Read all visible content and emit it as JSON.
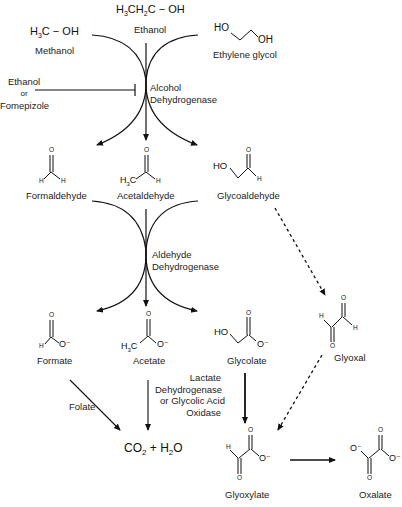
{
  "diagram": {
    "substrates": [
      {
        "id": "methanol",
        "formula": "H3C − OH",
        "name": "Methanol"
      },
      {
        "id": "ethanol",
        "formula": "H3CH2C − OH",
        "name": "Ethanol"
      },
      {
        "id": "ethylene_glycol",
        "formula_atoms": [
          "HO",
          "OH"
        ],
        "name": "Ethylene glycol"
      }
    ],
    "inhibitor": {
      "line1": "Ethanol",
      "line2": "or",
      "line3": "Fomepizole"
    },
    "enzymes": {
      "adh": {
        "line1": "Alcohol",
        "line2": "Dehydrogenase"
      },
      "aldh": {
        "line1": "Aldehyde",
        "line2": "Dehydrogenase"
      },
      "ldh": {
        "line1": "Lactate",
        "line2": "Dehydrogenase",
        "line3": "or Glycolic Acid",
        "line4": "Oxidase"
      },
      "folate": "Folate"
    },
    "aldehydes": [
      {
        "id": "formaldehyde",
        "name": "Formaldehyde",
        "atoms": {
          "o": "O",
          "h1": "H",
          "h2": "H"
        }
      },
      {
        "id": "acetaldehyde",
        "name": "Acetaldehyde",
        "atoms": {
          "o": "O",
          "r": "H3C",
          "h": "H"
        }
      },
      {
        "id": "glycoaldehyde",
        "name": "Glycoaldehyde",
        "atoms": {
          "ho": "HO",
          "o": "O",
          "h": "H"
        }
      }
    ],
    "acids": [
      {
        "id": "formate",
        "name": "Formate",
        "atoms": {
          "o": "O",
          "h": "H",
          "om": "O⁻"
        }
      },
      {
        "id": "acetate",
        "name": "Acetate",
        "atoms": {
          "o": "O",
          "r": "H3C",
          "om": "O⁻"
        }
      },
      {
        "id": "glycolate",
        "name": "Glycolate",
        "atoms": {
          "ho": "HO",
          "o": "O",
          "om": "O⁻"
        }
      }
    ],
    "glyoxal": {
      "name": "Glyoxal",
      "atoms": {
        "o1": "O",
        "h1": "H",
        "h2": "H",
        "o2": "O"
      }
    },
    "glyoxylate": {
      "name": "Glyoxylate",
      "atoms": {
        "o1": "O",
        "h": "H",
        "om": "O⁻",
        "o2": "O"
      }
    },
    "oxalate": {
      "name": "Oxalate",
      "atoms": {
        "o1": "O",
        "om1": "O⁻",
        "om2": "O⁻",
        "o2": "O"
      }
    },
    "product": {
      "formula": "CO2 + H2O"
    }
  }
}
